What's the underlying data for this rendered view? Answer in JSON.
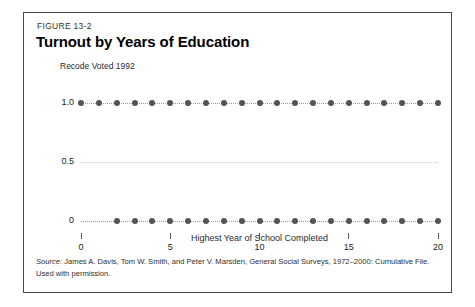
{
  "figure": {
    "number": "FIGURE 13-2",
    "title": "Turnout by Years of Education",
    "source_label": "Source:",
    "source_text": " James A. Davis, Tom W. Smith, and Peter V. Marsden, General Social Surveys, 1972–2000: Cumulative File. Used with permission."
  },
  "chart_data": {
    "type": "scatter",
    "title": "Turnout by Years of Education",
    "xlabel": "Highest Year of School Completed",
    "ylabel": "Recode Voted 1992",
    "xlim": [
      0,
      20
    ],
    "ylim": [
      0,
      1.0
    ],
    "grid": true,
    "legend": "none",
    "x_ticks": [
      0,
      5,
      10,
      15,
      20
    ],
    "x_tick_labels": [
      "0",
      "5",
      "10",
      "15",
      "20"
    ],
    "y_ticks": [
      1.0,
      0.5,
      0
    ],
    "y_tick_labels": [
      "1.0",
      "0.5",
      "0"
    ],
    "gridlines": [
      {
        "y": 1.0,
        "style": "dotted",
        "color": "#9a9a9a"
      },
      {
        "y": 0.5,
        "style": "dotted",
        "color": "#c4c4c4"
      },
      {
        "y": 0,
        "style": "dotted",
        "color": "#9a9a9a"
      }
    ],
    "marker_color": "#545454",
    "series": [
      {
        "name": "Voted (1)",
        "y": 1.0,
        "x": [
          0,
          1,
          2,
          3,
          4,
          5,
          6,
          7,
          8,
          9,
          10,
          11,
          12,
          13,
          14,
          15,
          16,
          17,
          18,
          19,
          20
        ]
      },
      {
        "name": "Did not vote (0)",
        "y": 0,
        "x": [
          2,
          3,
          4,
          5,
          6,
          7,
          8,
          9,
          10,
          11,
          12,
          13,
          14,
          15,
          16,
          17,
          18,
          19,
          20
        ]
      }
    ]
  }
}
